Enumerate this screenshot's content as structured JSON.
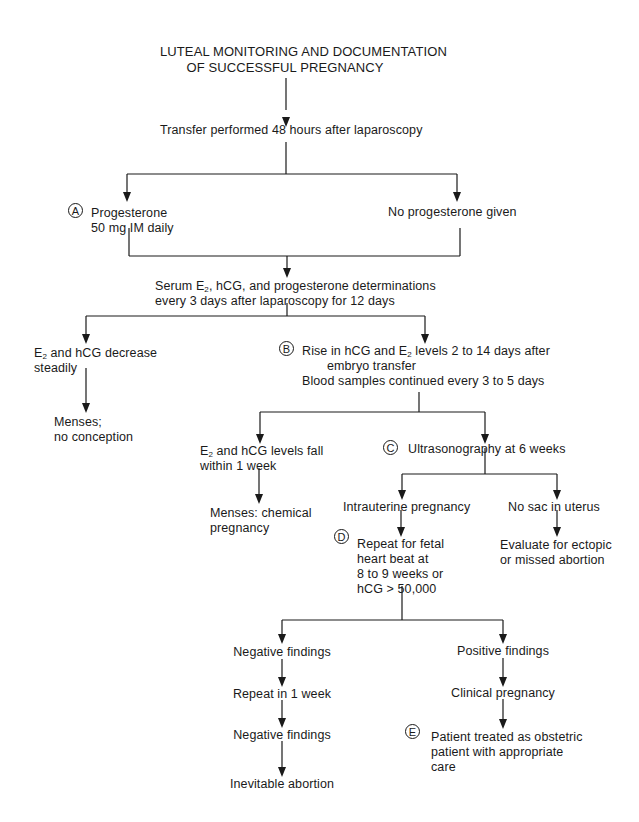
{
  "diagram": {
    "title_line1": "LUTEAL MONITORING AND DOCUMENTATION",
    "title_line2": "OF SUCCESSFUL PREGNANCY",
    "nodes": {
      "transfer": "Transfer performed 48 hours after laparoscopy",
      "progesterone_l1": "Progesterone",
      "progesterone_l2": "50 mg IM daily",
      "no_progesterone": "No progesterone given",
      "serum_l1_pre": "Serum E",
      "serum_l1_sub": "2",
      "serum_l1_post": ", hCG, and progesterone determinations",
      "serum_l2": "every 3 days after laparoscopy for 12 days",
      "decrease_l1_pre": "E",
      "decrease_l1_sub": "2",
      "decrease_l1_post": " and hCG decrease",
      "decrease_l2": "steadily",
      "menses_no_conception_l1": "Menses;",
      "menses_no_conception_l2": "no conception",
      "rise_l1_pre": "Rise in hCG and E",
      "rise_l1_sub": "2",
      "rise_l1_post": " levels 2 to 14 days after",
      "rise_l2": "embryo transfer",
      "rise_l3": "Blood samples continued every 3 to 5 days",
      "fall_l1_pre": "E",
      "fall_l1_sub": "2",
      "fall_l1_post": " and hCG levels fall",
      "fall_l2": "within 1 week",
      "chemical_l1": "Menses: chemical",
      "chemical_l2": "pregnancy",
      "ultrasonography": "Ultrasonography at 6 weeks",
      "intrauterine": "Intrauterine pregnancy",
      "no_sac": "No sac in uterus",
      "evaluate_l1": "Evaluate for ectopic",
      "evaluate_l2": "or missed abortion",
      "repeat_fetal_l1": "Repeat for fetal",
      "repeat_fetal_l2": "heart beat at",
      "repeat_fetal_l3": "8 to 9 weeks or",
      "repeat_fetal_l4": "hCG > 50,000",
      "negative_1": "Negative findings",
      "repeat_week": "Repeat in 1 week",
      "negative_2": "Negative findings",
      "inevitable": "Inevitable abortion",
      "positive": "Positive findings",
      "clinical": "Clinical pregnancy",
      "patient_l1": "Patient treated as obstetric",
      "patient_l2": "patient with appropriate",
      "patient_l3": "care"
    },
    "markers": {
      "a": "A",
      "b": "B",
      "c": "C",
      "d": "D",
      "e": "E"
    },
    "line_color": "#1a1a1a"
  }
}
